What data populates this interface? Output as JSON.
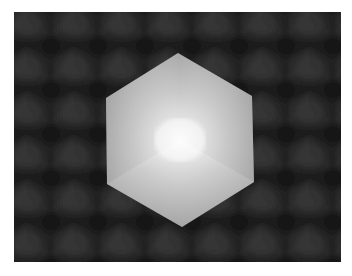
{
  "image": {
    "alt": "Shaded white hexagonal cube on a dark tiled cube-pattern background",
    "subject": "cube",
    "background_pattern": "tiled-cubes",
    "colors": {
      "page_background": "#ffffff",
      "scene_background": "#2a2a2a",
      "tile_dark": "#161616",
      "tile_light": "#3c3c3c",
      "cube_highlight": "#f7f7f7",
      "cube_mid": "#d2d2d2",
      "cube_edge": "#a6a6a6"
    },
    "cube_vertices": [
      [
        178,
        53
      ],
      [
        252,
        96
      ],
      [
        254,
        182
      ],
      [
        182,
        227
      ],
      [
        107,
        184
      ],
      [
        106,
        98
      ]
    ],
    "cube_center": [
      180,
      140
    ]
  }
}
